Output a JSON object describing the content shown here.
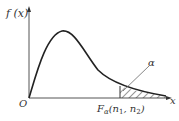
{
  "figure": {
    "type": "F-distribution density curve with upper-tail area",
    "y_axis_label": "f (x)",
    "x_axis_label": "x",
    "origin_label": "O",
    "critical_value_label": "F",
    "critical_value_subscript": "α",
    "critical_value_args": "(n",
    "arg1_sub": "1",
    "arg_sep": ", n",
    "arg2_sub": "2",
    "arg_close": ")",
    "tail_area_label": "α",
    "colors": {
      "curve": "#222222",
      "axes": "#555555",
      "hatch": "#333333"
    }
  }
}
